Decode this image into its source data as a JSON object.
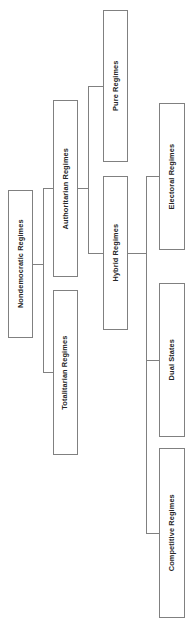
{
  "diagram": {
    "type": "hierarchy-tree",
    "orientation": "rotated-90-ccw",
    "line_color": "#808080",
    "text_color": "#262626",
    "background_color": "#ffffff",
    "nodes": [
      {
        "id": "nondemocratic-regimes",
        "label": "Nondemocratic Regimes",
        "level": 1,
        "x": 8,
        "y": 190,
        "w": 25,
        "h": 148
      },
      {
        "id": "authoritarian-regimes",
        "label": "Authoritarian Regimes",
        "level": 2,
        "x": 53,
        "y": 100,
        "w": 25,
        "h": 177
      },
      {
        "id": "totalitarian-regimes",
        "label": "Totalitarian Regimes",
        "level": 2,
        "x": 53,
        "y": 290,
        "w": 25,
        "h": 165
      },
      {
        "id": "pure-regimes",
        "label": "Pure Regimes",
        "level": 3,
        "x": 103,
        "y": 10,
        "w": 25,
        "h": 152
      },
      {
        "id": "hybrid-regimes",
        "label": "Hybrid Regimes",
        "level": 3,
        "x": 103,
        "y": 176,
        "w": 25,
        "h": 154
      },
      {
        "id": "electoral-regimes",
        "label": "Electoral Regimes",
        "level": 4,
        "x": 159,
        "y": 103,
        "w": 26,
        "h": 147
      },
      {
        "id": "dual-states",
        "label": "Dual States",
        "level": 4,
        "x": 159,
        "y": 283,
        "w": 26,
        "h": 154
      },
      {
        "id": "competitive-regimes",
        "label": "Competitive Regimes",
        "level": 4,
        "x": 159,
        "y": 448,
        "w": 26,
        "h": 170
      }
    ],
    "edges": [
      {
        "from": "nondemocratic-regimes",
        "to": "authoritarian-regimes"
      },
      {
        "from": "nondemocratic-regimes",
        "to": "totalitarian-regimes"
      },
      {
        "from": "authoritarian-regimes",
        "to": "pure-regimes"
      },
      {
        "from": "authoritarian-regimes",
        "to": "hybrid-regimes"
      },
      {
        "from": "hybrid-regimes",
        "to": "electoral-regimes"
      },
      {
        "from": "hybrid-regimes",
        "to": "dual-states"
      },
      {
        "from": "hybrid-regimes",
        "to": "competitive-regimes"
      }
    ],
    "connectors": [
      {
        "name": "root-stub",
        "o": "h",
        "x": 33,
        "y": 264,
        "len": 10
      },
      {
        "name": "root-spine",
        "o": "v",
        "x": 43,
        "y": 188,
        "len": 185
      },
      {
        "name": "branch-authoritarian",
        "o": "h",
        "x": 43,
        "y": 188,
        "len": 10
      },
      {
        "name": "branch-totalitarian",
        "o": "h",
        "x": 43,
        "y": 372,
        "len": 10
      },
      {
        "name": "auth-stub",
        "o": "h",
        "x": 78,
        "y": 188,
        "len": 10
      },
      {
        "name": "auth-spine",
        "o": "v",
        "x": 88,
        "y": 86,
        "len": 167
      },
      {
        "name": "branch-pure",
        "o": "h",
        "x": 88,
        "y": 86,
        "len": 15
      },
      {
        "name": "branch-hybrid",
        "o": "h",
        "x": 88,
        "y": 253,
        "len": 15
      },
      {
        "name": "hybrid-stub",
        "o": "h",
        "x": 128,
        "y": 253,
        "len": 18
      },
      {
        "name": "hybrid-spine",
        "o": "v",
        "x": 146,
        "y": 176,
        "len": 357
      },
      {
        "name": "branch-electoral",
        "o": "h",
        "x": 146,
        "y": 176,
        "len": 13
      },
      {
        "name": "branch-dual",
        "o": "h",
        "x": 146,
        "y": 360,
        "len": 13
      },
      {
        "name": "branch-competitive",
        "o": "h",
        "x": 146,
        "y": 533,
        "len": 13
      }
    ]
  }
}
